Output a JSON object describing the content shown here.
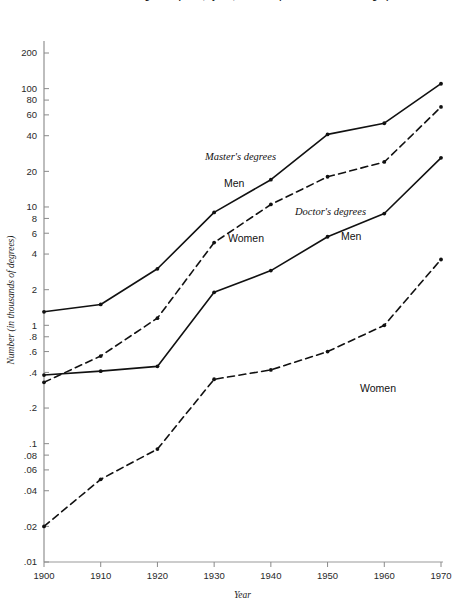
{
  "chart_data": {
    "type": "line",
    "title": "Number of master's and doctor's degree recipients, by sex, 1900-1970 (decade-to-decade changes)",
    "xlabel": "Year",
    "ylabel": "Number (in thousands of degrees)",
    "yscale": "log",
    "ylim": [
      0.01,
      300
    ],
    "xlim": [
      1900,
      1970
    ],
    "grid": false,
    "legend": "inline-annotations",
    "x": [
      1900,
      1910,
      1920,
      1930,
      1940,
      1950,
      1960,
      1970
    ],
    "x_ticks": [
      "1900",
      "1910",
      "1920",
      "1930",
      "1940",
      "1950",
      "1960",
      "1970"
    ],
    "y_ticks": [
      "200",
      "100",
      "80",
      "60",
      "40",
      "20",
      "10",
      "8",
      "6",
      "4",
      "2",
      "1",
      ".8",
      ".6",
      ".4",
      ".2",
      ".1",
      ".08",
      ".06",
      ".04",
      ".02",
      ".01"
    ],
    "y_tick_values": [
      200,
      100,
      80,
      60,
      40,
      20,
      10,
      8,
      6,
      4,
      2,
      1,
      0.8,
      0.6,
      0.4,
      0.2,
      0.1,
      0.08,
      0.06,
      0.04,
      0.02,
      0.01
    ],
    "series": [
      {
        "name": "Master's degrees — Men",
        "group": "Master's degrees",
        "sex": "Men",
        "style": "solid",
        "values": [
          1.3,
          1.5,
          3.0,
          9.0,
          17.0,
          41.0,
          51.0,
          110.0
        ]
      },
      {
        "name": "Master's degrees — Women",
        "group": "Master's degrees",
        "sex": "Women",
        "style": "dashed",
        "values": [
          0.33,
          0.55,
          1.15,
          5.0,
          10.5,
          18.0,
          24.0,
          70.0
        ]
      },
      {
        "name": "Doctor's degrees — Men",
        "group": "Doctor's degrees",
        "sex": "Men",
        "style": "solid",
        "values": [
          0.38,
          0.41,
          0.45,
          1.9,
          2.9,
          5.6,
          8.8,
          26.0
        ]
      },
      {
        "name": "Doctor's degrees — Women",
        "group": "Doctor's degrees",
        "sex": "Women",
        "style": "dashed",
        "values": [
          0.02,
          0.05,
          0.09,
          0.35,
          0.42,
          0.6,
          1.0,
          3.6
        ]
      }
    ],
    "annotations": [
      {
        "text": "Master's degrees",
        "x": 205,
        "y": 160,
        "font": "serif-italic"
      },
      {
        "text": "Men",
        "x": 224,
        "y": 187,
        "font": "sans"
      },
      {
        "text": "Women",
        "x": 228,
        "y": 242,
        "font": "sans"
      },
      {
        "text": "Doctor's degrees",
        "x": 295,
        "y": 215,
        "font": "serif-italic"
      },
      {
        "text": "Men",
        "x": 341,
        "y": 240,
        "font": "sans"
      },
      {
        "text": "Women",
        "x": 360,
        "y": 392,
        "font": "sans"
      }
    ]
  }
}
